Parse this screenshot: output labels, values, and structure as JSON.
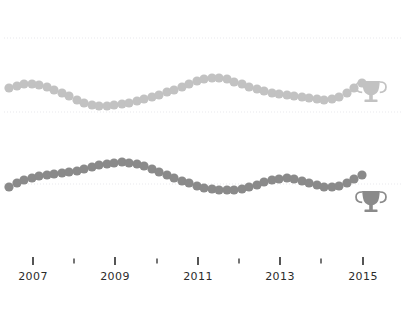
{
  "figure": {
    "title": "",
    "width": 409,
    "height": 312,
    "background": "#ffffff"
  },
  "colors": {
    "series_top": "#c2c2c2",
    "series_bottom": "#8a8a8a",
    "gridline": "#e8e8ec",
    "axis_tick": "#2b2b2b",
    "axis_text": "#2b2b2b",
    "trophy_top": "#c2c2c2",
    "trophy_bottom": "#8a8a8a"
  },
  "axis": {
    "name": "x-axis-years",
    "tick_labels": [
      "2007",
      "2009",
      "2011",
      "2013",
      "2015"
    ],
    "major_tick_x": [
      33,
      115,
      198,
      280,
      363
    ],
    "minor_tick_x": [
      74,
      157,
      239,
      321
    ],
    "tick_y": 257,
    "tick_length": 8,
    "label_y": 280
  },
  "markers": {
    "top": {
      "name": "trophy-icon-top",
      "label": "trophy-icon",
      "x": 371,
      "y": 93
    },
    "bottom": {
      "name": "trophy-icon-bottom",
      "label": "trophy-icon",
      "x": 371,
      "y": 203
    }
  },
  "chart_data": [
    {
      "type": "scatter",
      "name": "top-sparkline",
      "title": "",
      "xlabel": "",
      "ylabel": "",
      "grid": true,
      "legend": "none",
      "gridlines_y": [
        38,
        112
      ],
      "xlim": [
        2006.0,
        2015.6
      ],
      "ylim": [
        60,
        120
      ],
      "marker": "circle",
      "marker_size": 4.6,
      "color": "#c2c2c2",
      "x": [
        2006.0,
        2006.2,
        2006.4,
        2006.6,
        2006.8,
        2007.0,
        2007.2,
        2007.4,
        2007.6,
        2007.8,
        2008.0,
        2008.2,
        2008.4,
        2008.6,
        2008.8,
        2009.0,
        2009.2,
        2009.4,
        2009.6,
        2009.8,
        2010.0,
        2010.2,
        2010.4,
        2010.6,
        2010.8,
        2011.0,
        2011.2,
        2011.4,
        2011.6,
        2011.8,
        2012.0,
        2012.2,
        2012.4,
        2012.6,
        2012.8,
        2013.0,
        2013.2,
        2013.4,
        2013.6,
        2013.8,
        2014.0,
        2014.2,
        2014.4,
        2014.6,
        2014.8,
        2015.0,
        2015.2,
        2015.4
      ],
      "y": [
        88.5,
        89.0,
        89.5,
        89.6,
        89.2,
        88.4,
        87.2,
        85.8,
        84.3,
        82.8,
        81.6,
        80.8,
        80.4,
        80.5,
        80.8,
        81.3,
        81.9,
        82.6,
        83.4,
        84.3,
        85.3,
        86.4,
        87.6,
        88.9,
        90.2,
        91.4,
        92.2,
        92.6,
        92.5,
        91.9,
        90.9,
        89.7,
        88.5,
        87.4,
        86.5,
        85.8,
        85.2,
        84.7,
        84.2,
        83.7,
        83.2,
        82.8,
        82.6,
        82.9,
        83.8,
        85.4,
        87.6,
        90.0
      ],
      "pixel_x": [
        9,
        17,
        24,
        32,
        39,
        47,
        54,
        62,
        69,
        77,
        84,
        92,
        99,
        107,
        114,
        122,
        129,
        137,
        144,
        152,
        159,
        167,
        174,
        182,
        189,
        197,
        204,
        212,
        219,
        227,
        234,
        242,
        249,
        257,
        264,
        272,
        279,
        287,
        294,
        302,
        309,
        317,
        324,
        332,
        339,
        347,
        354,
        362
      ],
      "pixel_y": [
        88,
        86,
        84,
        84,
        85,
        87,
        90,
        93,
        96,
        100,
        103,
        105,
        106,
        106,
        105,
        104,
        103,
        101,
        99,
        97,
        95,
        92,
        90,
        87,
        84,
        81,
        79,
        78,
        78,
        79,
        82,
        84,
        87,
        89,
        91,
        93,
        94,
        95,
        96,
        97,
        98,
        99,
        100,
        99,
        97,
        93,
        88,
        83
      ]
    },
    {
      "type": "scatter",
      "name": "bottom-sparkline",
      "title": "",
      "xlabel": "",
      "ylabel": "",
      "grid": true,
      "legend": "none",
      "gridlines_y": [
        184
      ],
      "xlim": [
        2006.0,
        2015.6
      ],
      "ylim": [
        60,
        120
      ],
      "marker": "circle",
      "marker_size": 4.6,
      "color": "#8a8a8a",
      "x": [
        2006.0,
        2006.2,
        2006.4,
        2006.6,
        2006.8,
        2007.0,
        2007.2,
        2007.4,
        2007.6,
        2007.8,
        2008.0,
        2008.2,
        2008.4,
        2008.6,
        2008.8,
        2009.0,
        2009.2,
        2009.4,
        2009.6,
        2009.8,
        2010.0,
        2010.2,
        2010.4,
        2010.6,
        2010.8,
        2011.0,
        2011.2,
        2011.4,
        2011.6,
        2011.8,
        2012.0,
        2012.2,
        2012.4,
        2012.6,
        2012.8,
        2013.0,
        2013.2,
        2013.4,
        2013.6,
        2013.8,
        2014.0,
        2014.2,
        2014.4,
        2014.6,
        2014.8,
        2015.0,
        2015.2,
        2015.4
      ],
      "y": [
        86.0,
        87.4,
        88.5,
        89.3,
        89.9,
        90.3,
        90.7,
        91.1,
        91.5,
        92.0,
        92.6,
        93.3,
        94.0,
        94.6,
        95.0,
        95.2,
        95.0,
        94.5,
        93.7,
        92.7,
        91.5,
        90.3,
        89.1,
        88.0,
        87.0,
        86.1,
        85.4,
        84.9,
        84.6,
        84.5,
        84.7,
        85.1,
        85.8,
        86.7,
        87.6,
        88.4,
        88.9,
        89.0,
        88.7,
        88.1,
        87.3,
        86.5,
        85.9,
        85.7,
        86.2,
        87.4,
        89.0,
        90.6
      ],
      "pixel_x": [
        9,
        17,
        24,
        32,
        39,
        47,
        54,
        62,
        69,
        77,
        84,
        92,
        99,
        107,
        114,
        122,
        129,
        137,
        144,
        152,
        159,
        167,
        174,
        182,
        189,
        197,
        204,
        212,
        219,
        227,
        234,
        242,
        249,
        257,
        264,
        272,
        279,
        287,
        294,
        302,
        309,
        317,
        324,
        332,
        339,
        347,
        354,
        362
      ],
      "pixel_y": [
        187,
        183,
        180,
        178,
        176,
        175,
        174,
        173,
        172,
        171,
        169,
        167,
        165,
        164,
        163,
        162,
        163,
        164,
        166,
        169,
        172,
        175,
        178,
        181,
        183,
        186,
        188,
        189,
        190,
        190,
        190,
        189,
        187,
        185,
        182,
        180,
        179,
        178,
        179,
        181,
        183,
        185,
        187,
        187,
        186,
        183,
        179,
        175
      ]
    }
  ]
}
